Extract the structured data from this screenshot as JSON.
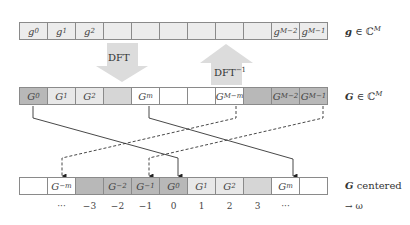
{
  "top_row": {
    "label": "g ∈ ℂ",
    "label_sup": "M",
    "cells": [
      {
        "text": "g",
        "sub": "0"
      },
      {
        "text": "g",
        "sub": "1"
      },
      {
        "text": "g",
        "sub": "2"
      },
      {
        "text": "",
        "sub": ""
      },
      {
        "text": "",
        "sub": ""
      },
      {
        "text": "",
        "sub": ""
      },
      {
        "text": "",
        "sub": ""
      },
      {
        "text": "",
        "sub": ""
      },
      {
        "text": "",
        "sub": ""
      },
      {
        "text": "g",
        "sub": "M−2"
      },
      {
        "text": "g",
        "sub": "M−1"
      }
    ]
  },
  "arrows": {
    "forward_label": "DFT",
    "inverse_label": "DFT",
    "inverse_sup": "−1"
  },
  "middle_row": {
    "label": "G ∈ ℂ",
    "label_sup": "M",
    "cells": [
      {
        "text": "G",
        "sub": "0",
        "shade": "dark"
      },
      {
        "text": "G",
        "sub": "1",
        "shade": "light"
      },
      {
        "text": "G",
        "sub": "2",
        "shade": "light"
      },
      {
        "text": "",
        "sub": "",
        "shade": "mid"
      },
      {
        "text": "G",
        "sub": "m",
        "shade": "white"
      },
      {
        "text": "",
        "sub": "",
        "shade": "white"
      },
      {
        "text": "",
        "sub": "",
        "shade": "white"
      },
      {
        "text": "G",
        "sub": "M−m",
        "shade": "white"
      },
      {
        "text": "",
        "sub": "",
        "shade": "dark"
      },
      {
        "text": "G",
        "sub": "M−2",
        "shade": "dark"
      },
      {
        "text": "G",
        "sub": "M−1",
        "shade": "dark"
      }
    ]
  },
  "bottom_row": {
    "label": "G",
    "label_suffix": " centered",
    "cells": [
      {
        "text": "",
        "sub": "",
        "shade": "white"
      },
      {
        "text": "G",
        "sub": "−m",
        "shade": "white"
      },
      {
        "text": "",
        "sub": "",
        "shade": "dark"
      },
      {
        "text": "G",
        "sub": "−2",
        "shade": "dark"
      },
      {
        "text": "G",
        "sub": "−1",
        "shade": "dark"
      },
      {
        "text": "G",
        "sub": "0",
        "shade": "dark"
      },
      {
        "text": "G",
        "sub": "1",
        "shade": "light"
      },
      {
        "text": "G",
        "sub": "2",
        "shade": "light"
      },
      {
        "text": "",
        "sub": "",
        "shade": "mid"
      },
      {
        "text": "G",
        "sub": "m",
        "shade": "white"
      },
      {
        "text": "",
        "sub": "",
        "shade": "white"
      }
    ]
  },
  "axis": {
    "ticks": [
      "",
      "···",
      "−3",
      "−2",
      "−1",
      "0",
      "1",
      "2",
      "3",
      "···",
      ""
    ],
    "label": "→ ω"
  }
}
